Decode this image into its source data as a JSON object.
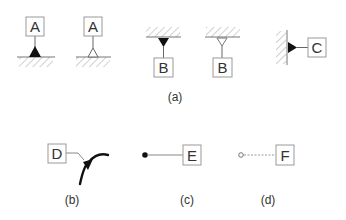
{
  "figure": {
    "panels": [
      {
        "caption": "(a)",
        "symbols": [
          {
            "label": "A",
            "marker": "filled-triangle",
            "surface": "bottom"
          },
          {
            "label": "A",
            "marker": "open-triangle",
            "surface": "bottom"
          },
          {
            "label": "B",
            "marker": "filled-triangle",
            "surface": "top"
          },
          {
            "label": "B",
            "marker": "open-triangle",
            "surface": "top"
          },
          {
            "label": "C",
            "marker": "filled-triangle",
            "surface": "left"
          }
        ]
      },
      {
        "caption": "(b)",
        "symbols": [
          {
            "label": "D",
            "marker": "filled-triangle-on-curve"
          }
        ]
      },
      {
        "caption": "(c)",
        "symbols": [
          {
            "label": "E",
            "marker": "filled-dot",
            "line": "solid"
          }
        ]
      },
      {
        "caption": "(d)",
        "symbols": [
          {
            "label": "F",
            "marker": "open-circle",
            "line": "dashed"
          }
        ]
      }
    ],
    "colors": {
      "line": "#555555",
      "fill": "#111111",
      "hatch": "#bbbbbb",
      "box": "#999999"
    }
  }
}
